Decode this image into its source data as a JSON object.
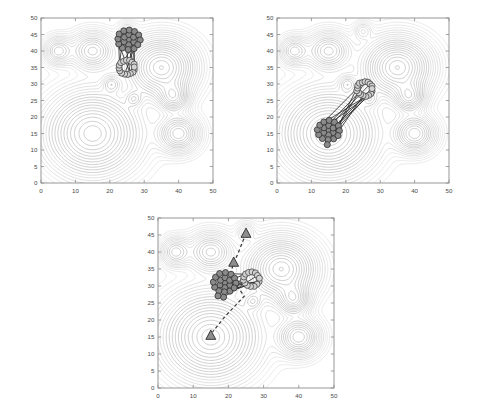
{
  "figure": {
    "title": "",
    "background": "#ffffff",
    "panel_count": 3,
    "layout": "2-on-top, 1-centered-below"
  },
  "chart_data": {
    "type": "contour",
    "title": "",
    "xlabel": "",
    "ylabel": "",
    "xlim": [
      0,
      50
    ],
    "ylim": [
      0,
      50
    ],
    "xticks": [
      0,
      10,
      20,
      30,
      40,
      50
    ],
    "yticks": [
      0,
      5,
      10,
      15,
      20,
      25,
      30,
      35,
      40,
      45,
      50
    ],
    "grid": false,
    "legend": "none",
    "contour_color": "#b9b9b9",
    "axis_color": "#8c8c8c",
    "label_color": "#4a4a4a",
    "field_peaks": [
      {
        "id": "peak-large-lower-left",
        "x": 15,
        "y": 15,
        "amplitude": 1.0,
        "sigma_x": 7.5,
        "sigma_y": 7.0,
        "rings": 13
      },
      {
        "id": "peak-large-right",
        "x": 35,
        "y": 35,
        "amplitude": 0.95,
        "sigma_x": 5.5,
        "sigma_y": 5.0,
        "rings": 11
      },
      {
        "id": "peak-mid-right-lower",
        "x": 38.5,
        "y": 26,
        "amplitude": 0.55,
        "sigma_x": 2.6,
        "sigma_y": 2.6,
        "rings": 6
      },
      {
        "id": "peak-right-bottom",
        "x": 40,
        "y": 15,
        "amplitude": 0.6,
        "sigma_x": 3.4,
        "sigma_y": 3.2,
        "rings": 7
      },
      {
        "id": "peak-top-mid-left",
        "x": 15,
        "y": 40,
        "amplitude": 0.5,
        "sigma_x": 3.6,
        "sigma_y": 3.2,
        "rings": 7
      },
      {
        "id": "peak-top-far-left",
        "x": 5,
        "y": 40,
        "amplitude": 0.38,
        "sigma_x": 2.4,
        "sigma_y": 2.4,
        "rings": 5
      },
      {
        "id": "peak-small-center",
        "x": 20.5,
        "y": 30,
        "amplitude": 0.25,
        "sigma_x": 1.6,
        "sigma_y": 1.6,
        "rings": 4
      },
      {
        "id": "peak-small-center-low",
        "x": 27,
        "y": 25.5,
        "amplitude": 0.22,
        "sigma_x": 1.5,
        "sigma_y": 1.5,
        "rings": 4
      },
      {
        "id": "peak-tiny-top",
        "x": 25,
        "y": 46,
        "amplitude": 0.15,
        "sigma_x": 1.6,
        "sigma_y": 1.6,
        "rings": 3
      }
    ],
    "panels": [
      {
        "id": "panel-top-left",
        "position": "top-left",
        "swarm": {
          "dark_cluster_center": [
            25.5,
            43.5
          ],
          "light_cluster_center": [
            25.0,
            35.0
          ],
          "orientation_deg": 90,
          "dark_agent_count": 19,
          "light_agent_count": 16,
          "link_count": 10
        },
        "markers": []
      },
      {
        "id": "panel-top-right",
        "position": "top-right",
        "swarm": {
          "dark_cluster_center": [
            15.0,
            16.0
          ],
          "light_cluster_center": [
            25.5,
            28.5
          ],
          "orientation_deg": 50,
          "dark_agent_count": 20,
          "light_agent_count": 17,
          "link_count": 11
        },
        "markers": []
      },
      {
        "id": "panel-bottom-center",
        "position": "bottom-center",
        "swarm": {
          "dark_cluster_center": [
            19.0,
            31.0
          ],
          "light_cluster_center": [
            26.5,
            32.0
          ],
          "orientation_deg": 10,
          "dark_agent_count": 21,
          "light_agent_count": 14,
          "link_count": 10
        },
        "markers": [
          {
            "name": "target-marker-top",
            "x": 25,
            "y": 45.5,
            "shape": "triangle",
            "fill": "#8e8e8e"
          },
          {
            "name": "target-marker-middle",
            "x": 21.5,
            "y": 37,
            "shape": "triangle",
            "fill": "#8e8e8e"
          },
          {
            "name": "target-marker-bottom",
            "x": 15,
            "y": 15.5,
            "shape": "triangle",
            "fill": "#8e8e8e"
          }
        ],
        "path": {
          "name": "dashed-trajectory",
          "style": "dashed",
          "color": "#3a3a3a",
          "points": [
            [
              25,
              45.5
            ],
            [
              22.5,
              39
            ],
            [
              21.5,
              37
            ],
            [
              20.5,
              33
            ],
            [
              24.5,
              27
            ],
            [
              19,
              21
            ],
            [
              15.5,
              16.5
            ]
          ]
        }
      }
    ]
  },
  "axes": {
    "x_tick_labels": [
      "0",
      "10",
      "20",
      "30",
      "40",
      "50"
    ],
    "y_tick_labels": [
      "0",
      "5",
      "10",
      "15",
      "20",
      "25",
      "30",
      "35",
      "40",
      "45",
      "50"
    ]
  }
}
